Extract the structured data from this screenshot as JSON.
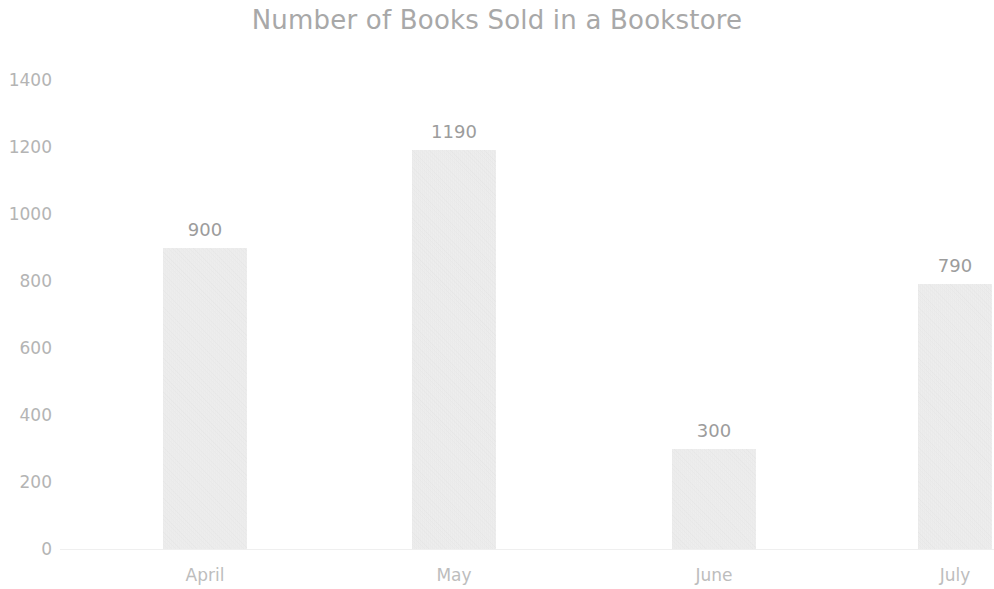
{
  "chart_data": {
    "type": "bar",
    "title": "Number of Books Sold in a Bookstore",
    "xlabel": "",
    "ylabel": "",
    "categories": [
      "April",
      "May",
      "June",
      "July"
    ],
    "values": [
      900,
      1190,
      300,
      790
    ],
    "data_labels": [
      "900",
      "1190",
      "300",
      "790"
    ],
    "series": [
      {
        "name": "Books Sold",
        "values": [
          900,
          1190,
          300,
          790
        ]
      }
    ],
    "ylim": [
      0,
      1400
    ],
    "ytick_values": [
      0,
      200,
      400,
      600,
      800,
      1000,
      1200,
      1400
    ],
    "ytick_labels": [
      "0",
      "200",
      "400",
      "600",
      "800",
      "1000",
      "1200",
      "1400"
    ],
    "grid": false,
    "legend": false,
    "legend_position": "none",
    "colors": {
      "bar_fill": "#ebebeb",
      "title_text": "#a8a8a8",
      "tick_text": "#b4b4b4",
      "category_text": "#bdbdbd",
      "data_label_text": "#9c9c9c",
      "axis_line": "#efefef",
      "background": "#ffffff"
    }
  }
}
